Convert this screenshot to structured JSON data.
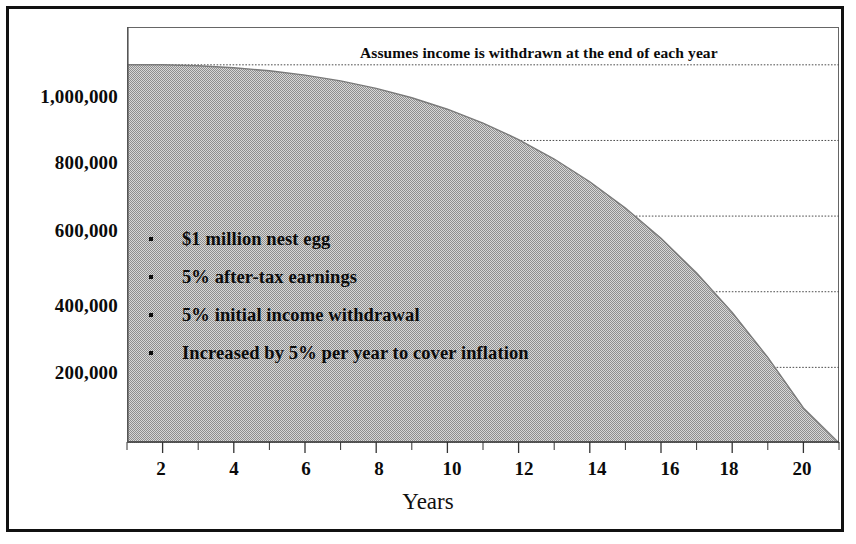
{
  "annotation": "Assumes income is withdrawn at the end of each year",
  "axis": {
    "x_title": "Years",
    "x_ticks": [
      "2",
      "4",
      "6",
      "8",
      "10",
      "12",
      "14",
      "16",
      "18",
      "20"
    ],
    "y_ticks": [
      "1,000,000",
      "800,000",
      "600,000",
      "400,000",
      "200,000"
    ]
  },
  "bullets": [
    "$1 million nest egg",
    "5% after-tax earnings",
    "5% initial income withdrawal",
    "Increased by 5% per year to cover inflation"
  ],
  "colors": {
    "fill": "#b9b9b9",
    "frame": "#111111",
    "plot_border": "#666666",
    "gridline": "#4d4d4d",
    "text": "#0b0b0b"
  },
  "chart_data": {
    "type": "area",
    "title": "",
    "subtitle": "Assumes income is withdrawn at the end of each year",
    "xlabel": "Years",
    "ylabel": "",
    "xlim": [
      1,
      21
    ],
    "ylim": [
      0,
      1100000
    ],
    "grid": true,
    "legend": "none",
    "x_tick_values": [
      2,
      4,
      6,
      8,
      10,
      12,
      14,
      16,
      18,
      20
    ],
    "y_tick_values": [
      200000,
      400000,
      600000,
      800000,
      1000000
    ],
    "series": [
      {
        "name": "Remaining nest egg",
        "x": [
          1,
          2,
          3,
          4,
          5,
          6,
          7,
          8,
          9,
          10,
          11,
          12,
          13,
          14,
          15,
          16,
          17,
          18,
          19,
          20,
          21
        ],
        "values": [
          1000000,
          1000000,
          997500,
          992400,
          984300,
          972800,
          957400,
          937600,
          912900,
          882600,
          846000,
          802400,
          750900,
          690800,
          621200,
          541100,
          449400,
          344900,
          226400,
          92700,
          0
        ]
      }
    ],
    "assumptions": {
      "starting_balance": 1000000,
      "after_tax_return_pct": 5,
      "initial_withdrawal_rate_pct": 5,
      "withdrawal_increase_pct_per_year": 5,
      "withdrawal_timing": "end of each year"
    }
  }
}
